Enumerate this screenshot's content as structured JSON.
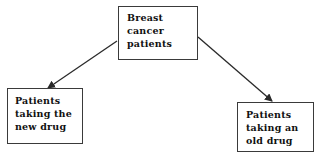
{
  "diagram": {
    "nodes": [
      {
        "id": "root",
        "lines": [
          "Breast",
          "cancer",
          "patients"
        ]
      },
      {
        "id": "new_drug",
        "lines": [
          "Patients",
          "taking the",
          "new drug"
        ]
      },
      {
        "id": "old_drug",
        "lines": [
          "Patients",
          "taking an",
          "old drug"
        ]
      }
    ],
    "edges": [
      {
        "from": "root",
        "to": "new_drug"
      },
      {
        "from": "root",
        "to": "old_drug"
      }
    ],
    "colors": {
      "line": "#2a2a2a",
      "text": "#111111",
      "background": "#ffffff"
    }
  }
}
